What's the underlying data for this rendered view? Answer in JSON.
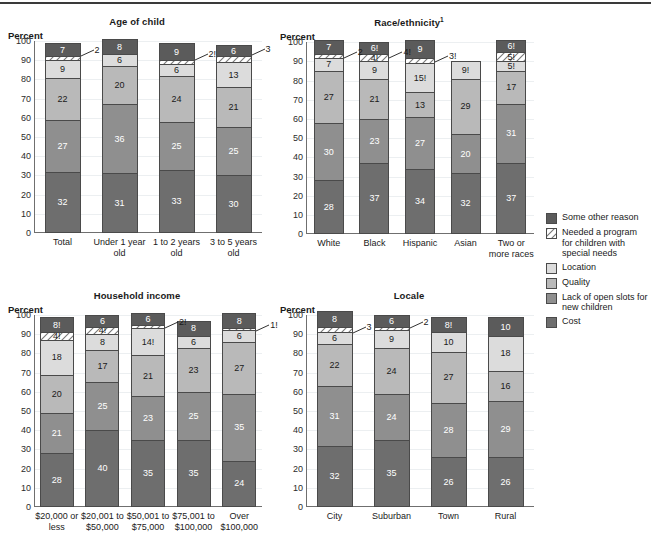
{
  "colors": {
    "cost": "#6e6e6e",
    "lack_of_slots": "#8f8f8f",
    "quality": "#b9b9b9",
    "location": "#dcdcdc",
    "special_needs": "#ffffff",
    "other": "#5b5b5b",
    "axis": "#6f6f6f",
    "grid": "#eceff1",
    "rule": "#3a3a3a"
  },
  "legend": {
    "name": "legend",
    "items": [
      {
        "key": "other",
        "label": "Some other reason",
        "color": "#5b5b5b",
        "hatched": false
      },
      {
        "key": "special_needs",
        "label": "Needed a program for children with special needs",
        "color": "#ffffff",
        "hatched": true
      },
      {
        "key": "location",
        "label": "Location",
        "color": "#dcdcdc",
        "hatched": false
      },
      {
        "key": "quality",
        "label": "Quality",
        "color": "#b9b9b9",
        "hatched": false
      },
      {
        "key": "lack_of_slots",
        "label": "Lack of open slots for new children",
        "color": "#8f8f8f",
        "hatched": false
      },
      {
        "key": "cost",
        "label": "Cost",
        "color": "#6e6e6e",
        "hatched": false
      }
    ]
  },
  "axis": {
    "percent_label": "Percent",
    "ticks": [
      "100",
      "90",
      "80",
      "70",
      "60",
      "50",
      "40",
      "30",
      "20",
      "10",
      "0"
    ],
    "ylim": [
      0,
      100
    ]
  },
  "chart_data": [
    {
      "id": "age-of-child",
      "type": "bar",
      "stacked": true,
      "title": "Age of child",
      "title_sup": "",
      "ylabel": "Percent",
      "xlabel": "",
      "ylim": [
        0,
        100
      ],
      "grid": true,
      "legend_position": "right-outside",
      "series_order": [
        "cost",
        "lack_of_slots",
        "quality",
        "location",
        "special_needs",
        "other"
      ],
      "categories": [
        "Total",
        "Under 1 year old",
        "1 to 2 years old",
        "3 to 5 years old"
      ],
      "series": [
        {
          "name": "Cost",
          "key": "cost",
          "values": [
            32,
            31,
            33,
            30
          ],
          "labels": [
            "32",
            "31",
            "33",
            "30"
          ]
        },
        {
          "name": "Lack of open slots for new children",
          "key": "lack_of_slots",
          "values": [
            27,
            36,
            25,
            25
          ],
          "labels": [
            "27",
            "36",
            "25",
            "25"
          ]
        },
        {
          "name": "Quality",
          "key": "quality",
          "values": [
            22,
            20,
            24,
            21
          ],
          "labels": [
            "22",
            "20",
            "24",
            "21"
          ]
        },
        {
          "name": "Location",
          "key": "location",
          "values": [
            9,
            6,
            6,
            13
          ],
          "labels": [
            "9",
            "6",
            "6",
            "13"
          ]
        },
        {
          "name": "Needed a program for children with special needs",
          "key": "special_needs",
          "values": [
            2,
            0,
            2,
            3
          ],
          "labels": [
            "2",
            "",
            "2!",
            "3"
          ]
        },
        {
          "name": "Some other reason",
          "key": "other",
          "values": [
            7,
            8,
            9,
            6
          ],
          "labels": [
            "7",
            "8",
            "9",
            "6"
          ]
        }
      ],
      "callouts": [
        {
          "text": "2",
          "bar": 0
        },
        {
          "text": "2!",
          "bar": 2
        },
        {
          "text": "3",
          "bar": 3
        }
      ]
    },
    {
      "id": "race-ethnicity",
      "type": "bar",
      "stacked": true,
      "title": "Race/ethnicity",
      "title_sup": "1",
      "ylabel": "Percent",
      "xlabel": "",
      "ylim": [
        0,
        100
      ],
      "grid": true,
      "legend_position": "right-outside",
      "series_order": [
        "cost",
        "lack_of_slots",
        "quality",
        "location",
        "special_needs",
        "other"
      ],
      "categories": [
        "White",
        "Black",
        "Hispanic",
        "Asian",
        "Two or more races"
      ],
      "series": [
        {
          "name": "Cost",
          "key": "cost",
          "values": [
            28,
            37,
            34,
            32,
            37
          ],
          "labels": [
            "28",
            "37",
            "34",
            "32",
            "37"
          ]
        },
        {
          "name": "Lack of open slots for new children",
          "key": "lack_of_slots",
          "values": [
            30,
            23,
            27,
            20,
            31
          ],
          "labels": [
            "30",
            "23",
            "27",
            "20",
            "31"
          ]
        },
        {
          "name": "Quality",
          "key": "quality",
          "values": [
            27,
            21,
            13,
            29,
            17
          ],
          "labels": [
            "27",
            "21",
            "13",
            "29",
            "17"
          ]
        },
        {
          "name": "Location",
          "key": "location",
          "values": [
            7,
            9,
            15,
            9,
            5
          ],
          "labels": [
            "7",
            "9",
            "15!",
            "9!",
            "5!"
          ]
        },
        {
          "name": "Needed a program for children with special needs",
          "key": "special_needs",
          "values": [
            2,
            4,
            3,
            0,
            5
          ],
          "labels": [
            "2",
            "4!",
            "3!",
            "",
            "5!"
          ]
        },
        {
          "name": "Some other reason",
          "key": "other",
          "values": [
            7,
            6,
            9,
            0,
            6
          ],
          "labels": [
            "7",
            "6!",
            "9",
            "",
            "6!"
          ]
        }
      ],
      "callouts": [
        {
          "text": "2",
          "bar": 0
        },
        {
          "text": "4!",
          "bar": 1
        },
        {
          "text": "3!",
          "bar": 2
        }
      ]
    },
    {
      "id": "household-income",
      "type": "bar",
      "stacked": true,
      "title": "Household income",
      "title_sup": "",
      "ylabel": "Percent",
      "xlabel": "",
      "ylim": [
        0,
        100
      ],
      "grid": true,
      "legend_position": "right-outside",
      "series_order": [
        "cost",
        "lack_of_slots",
        "quality",
        "location",
        "special_needs",
        "other"
      ],
      "categories": [
        "$20,000 or less",
        "$20,001 to $50,000",
        "$50,001 to $75,000",
        "$75,001 to $100,000",
        "Over $100,000"
      ],
      "series": [
        {
          "name": "Cost",
          "key": "cost",
          "values": [
            28,
            40,
            35,
            35,
            24
          ],
          "labels": [
            "28",
            "40",
            "35",
            "35",
            "24"
          ]
        },
        {
          "name": "Lack of open slots for new children",
          "key": "lack_of_slots",
          "values": [
            21,
            25,
            23,
            25,
            35
          ],
          "labels": [
            "21",
            "25",
            "23",
            "25",
            "35"
          ]
        },
        {
          "name": "Quality",
          "key": "quality",
          "values": [
            20,
            17,
            21,
            23,
            27
          ],
          "labels": [
            "20",
            "17",
            "21",
            "23",
            "27"
          ]
        },
        {
          "name": "Location",
          "key": "location",
          "values": [
            18,
            8,
            14,
            6,
            6
          ],
          "labels": [
            "18",
            "8",
            "14!",
            "6",
            "6"
          ]
        },
        {
          "name": "Needed a program for children with special needs",
          "key": "special_needs",
          "values": [
            4,
            4,
            2,
            0,
            1
          ],
          "labels": [
            "4!",
            "4!",
            "2!",
            "",
            "1!"
          ]
        },
        {
          "name": "Some other reason",
          "key": "other",
          "values": [
            8,
            6,
            6,
            8,
            8
          ],
          "labels": [
            "8!",
            "6",
            "6",
            "8",
            "8"
          ]
        }
      ],
      "callouts": [
        {
          "text": "2!",
          "bar": 2
        },
        {
          "text": "1!",
          "bar": 4
        }
      ]
    },
    {
      "id": "locale",
      "type": "bar",
      "stacked": true,
      "title": "Locale",
      "title_sup": "",
      "ylabel": "Percent",
      "xlabel": "",
      "ylim": [
        0,
        100
      ],
      "grid": true,
      "legend_position": "right-outside",
      "series_order": [
        "cost",
        "lack_of_slots",
        "quality",
        "location",
        "special_needs",
        "other"
      ],
      "categories": [
        "City",
        "Suburban",
        "Town",
        "Rural"
      ],
      "series": [
        {
          "name": "Cost",
          "key": "cost",
          "values": [
            32,
            35,
            26,
            26
          ],
          "labels": [
            "32",
            "35",
            "26",
            "26"
          ]
        },
        {
          "name": "Lack of open slots for new children",
          "key": "lack_of_slots",
          "values": [
            31,
            24,
            28,
            29
          ],
          "labels": [
            "31",
            "24",
            "28",
            "29"
          ]
        },
        {
          "name": "Quality",
          "key": "quality",
          "values": [
            22,
            24,
            27,
            16
          ],
          "labels": [
            "22",
            "24",
            "27",
            "16"
          ]
        },
        {
          "name": "Location",
          "key": "location",
          "values": [
            6,
            9,
            10,
            18
          ],
          "labels": [
            "6",
            "9",
            "10",
            "18"
          ]
        },
        {
          "name": "Needed a program for children with special needs",
          "key": "special_needs",
          "values": [
            3,
            2,
            0,
            0
          ],
          "labels": [
            "3",
            "2",
            "",
            ""
          ]
        },
        {
          "name": "Some other reason",
          "key": "other",
          "values": [
            8,
            6,
            8,
            10
          ],
          "labels": [
            "8",
            "6",
            "8!",
            "10"
          ]
        }
      ],
      "callouts": [
        {
          "text": "3",
          "bar": 0
        },
        {
          "text": "2",
          "bar": 1
        }
      ]
    }
  ]
}
